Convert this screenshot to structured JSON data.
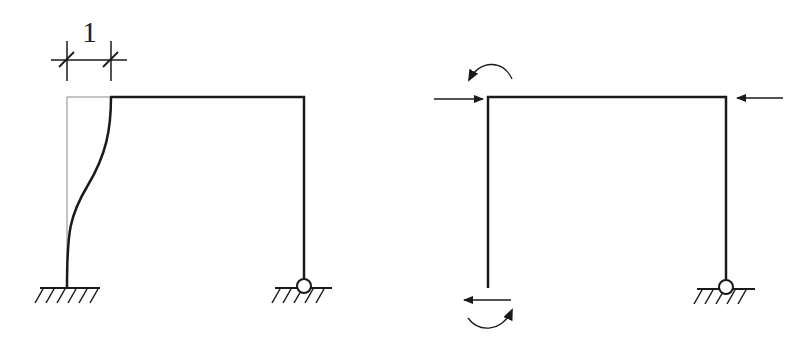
{
  "diagram": {
    "left_frame": {
      "description": "Portal frame with fixed left support and pinned right support; left column shown deflected by unit displacement",
      "dimension_label": "1",
      "supports": [
        "fixed",
        "pin"
      ]
    },
    "right_frame": {
      "description": "Portal frame with released left support, showing applied horizontal forces and moments",
      "supports": [
        "released",
        "pin"
      ],
      "loads": [
        "force-right-top-left",
        "moment-ccw-top-left",
        "force-left-top-right",
        "force-left-bottom-left",
        "moment-cw-bottom-left"
      ]
    },
    "colors": {
      "line": "#1a1a1a",
      "ghost": "#b0b0b0"
    }
  }
}
